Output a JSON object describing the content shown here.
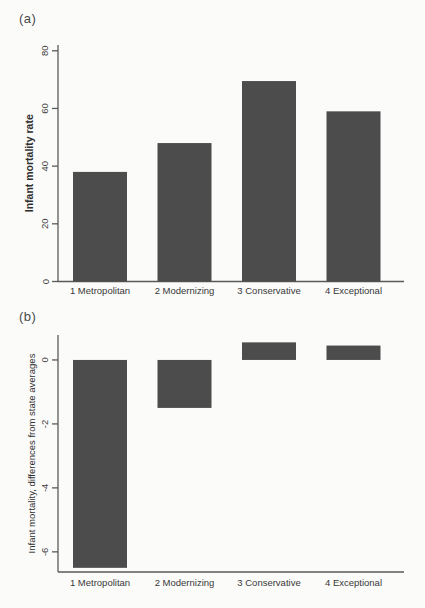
{
  "figure": {
    "background_color": "#fbfbfa",
    "bar_color": "#4c4c4c",
    "axis_color": "#5a5a5a",
    "panel_a_label": "(a)",
    "panel_b_label": "(b)"
  },
  "chart_data": [
    {
      "type": "bar",
      "panel_label": "(a)",
      "title": "",
      "xlabel": "",
      "ylabel": "Infant mortality rate",
      "ylabel_bold": true,
      "categories": [
        "1 Metropolitan",
        "2 Modernizing",
        "3 Conservative",
        "4 Exceptional"
      ],
      "values": [
        38,
        48,
        69.5,
        59
      ],
      "yticks": [
        0,
        20,
        40,
        60,
        80
      ],
      "ylim": [
        0,
        82
      ],
      "bar_color": "#4c4c4c",
      "grid": false,
      "legend": "none",
      "tick_label_rotation": 90
    },
    {
      "type": "bar",
      "panel_label": "(b)",
      "title": "",
      "xlabel": "",
      "ylabel": "Infant mortality, differences from state averages",
      "ylabel_bold": false,
      "categories": [
        "1 Metropolitan",
        "2 Modernizing",
        "3 Conservative",
        "4 Exceptional"
      ],
      "values": [
        -6.5,
        -1.5,
        0.55,
        0.45
      ],
      "yticks": [
        0,
        -2,
        -4,
        -6
      ],
      "ylim": [
        -6.63,
        0.78
      ],
      "bar_color": "#4c4c4c",
      "grid": false,
      "legend": "none",
      "tick_label_rotation": 90
    }
  ]
}
